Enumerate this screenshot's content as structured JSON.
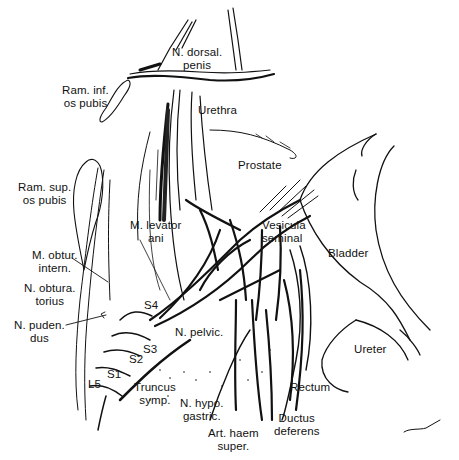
{
  "figure": {
    "labels": [
      {
        "id": "n-dorsal-penis",
        "text": "N. dorsal.\npenis",
        "x": 172,
        "y": 46,
        "align": "c"
      },
      {
        "id": "ram-inf-os-pubis",
        "text": "Ram. inf.\nos pubis",
        "x": 62,
        "y": 84,
        "align": "c"
      },
      {
        "id": "urethra",
        "text": "Urethra",
        "x": 198,
        "y": 104,
        "align": "l"
      },
      {
        "id": "prostate",
        "text": "Prostate",
        "x": 238,
        "y": 159,
        "align": "l"
      },
      {
        "id": "ram-sup-os-pubis",
        "text": "Ram. sup.\nos pubis",
        "x": 18,
        "y": 181,
        "align": "c"
      },
      {
        "id": "m-levator-ani",
        "text": "M. levator\nani",
        "x": 130,
        "y": 219,
        "align": "c"
      },
      {
        "id": "vesicula-seminal",
        "text": "Vesicula\nseminal",
        "x": 262,
        "y": 219,
        "align": "l"
      },
      {
        "id": "bladder",
        "text": "Bladder",
        "x": 328,
        "y": 247,
        "align": "l"
      },
      {
        "id": "m-obtur-intern",
        "text": "M. obtur.\nintern.",
        "x": 32,
        "y": 249,
        "align": "c"
      },
      {
        "id": "n-obturatorius",
        "text": "N. obtura.\ntorius",
        "x": 24,
        "y": 282,
        "align": "c"
      },
      {
        "id": "s4",
        "text": "S4",
        "x": 144,
        "y": 299,
        "align": "l"
      },
      {
        "id": "n-pudendus",
        "text": "N. puden.\ndus",
        "x": 14,
        "y": 319,
        "align": "c"
      },
      {
        "id": "n-pelvic",
        "text": "N. pelvic.",
        "x": 175,
        "y": 326,
        "align": "l"
      },
      {
        "id": "ureter",
        "text": "Ureter",
        "x": 354,
        "y": 343,
        "align": "l"
      },
      {
        "id": "s3",
        "text": "S3",
        "x": 143,
        "y": 343,
        "align": "l"
      },
      {
        "id": "s2",
        "text": "S2",
        "x": 129,
        "y": 353,
        "align": "l"
      },
      {
        "id": "s1",
        "text": "S1",
        "x": 107,
        "y": 368,
        "align": "l"
      },
      {
        "id": "l5",
        "text": "L5",
        "x": 88,
        "y": 378,
        "align": "l"
      },
      {
        "id": "rectum",
        "text": "Rectum",
        "x": 290,
        "y": 381,
        "align": "l"
      },
      {
        "id": "truncus-symp",
        "text": "Truncus\nsymp.",
        "x": 134,
        "y": 381,
        "align": "c"
      },
      {
        "id": "n-hypogastric",
        "text": "N. hypo.\ngastric.",
        "x": 180,
        "y": 397,
        "align": "c"
      },
      {
        "id": "ductus-deferens",
        "text": "Ductus\ndeferens",
        "x": 274,
        "y": 412,
        "align": "c"
      },
      {
        "id": "art-haem-super",
        "text": "Art. haem\nsuper.",
        "x": 208,
        "y": 427,
        "align": "c"
      }
    ]
  }
}
